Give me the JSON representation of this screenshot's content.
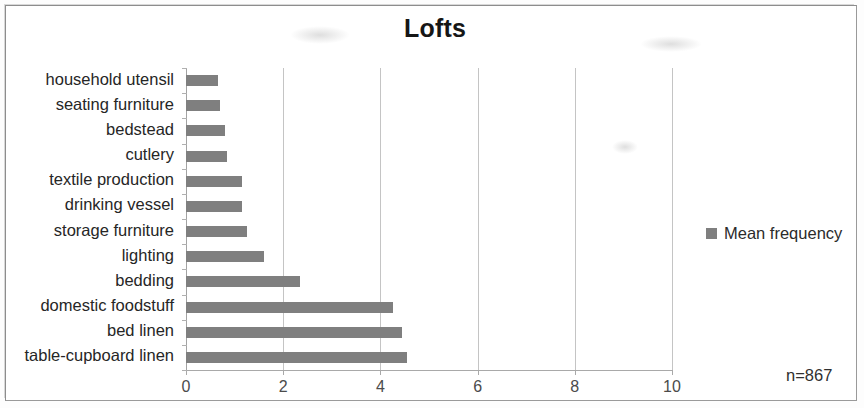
{
  "figure": {
    "title": "Lofts",
    "sample_note": "n=867"
  },
  "legend": {
    "position": "right",
    "entries": [
      {
        "label": "Mean frequency",
        "color": "#7f7f7f",
        "marker": "square"
      }
    ]
  },
  "axis": {
    "x_ticks": [
      "0",
      "2",
      "4",
      "6",
      "8",
      "10"
    ]
  },
  "chart_data": {
    "type": "bar",
    "orientation": "horizontal",
    "title": "Lofts",
    "xlabel": "",
    "ylabel": "",
    "xlim": [
      0,
      10
    ],
    "grid": true,
    "legend_position": "right",
    "annotation": "n=867",
    "series": [
      {
        "name": "Mean frequency",
        "color": "#7f7f7f",
        "values": [
          0.65,
          0.7,
          0.8,
          0.85,
          1.15,
          1.15,
          1.25,
          1.6,
          2.35,
          4.25,
          4.45,
          4.55
        ]
      }
    ],
    "categories": [
      "household utensil",
      "seating furniture",
      "bedstead",
      "cutlery",
      "textile production",
      "drinking vessel",
      "storage furniture",
      "lighting",
      "bedding",
      "domestic foodstuff",
      "bed linen",
      "table-cupboard linen"
    ],
    "x_ticks": [
      0,
      2,
      4,
      6,
      8,
      10
    ]
  }
}
